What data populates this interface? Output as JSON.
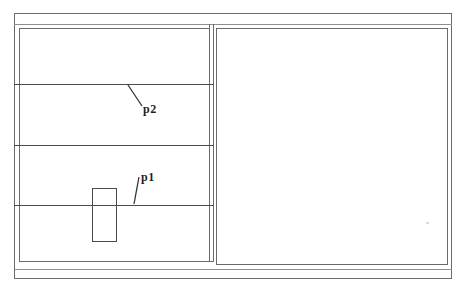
{
  "drawing": {
    "kind": "cad-plan-line-drawing",
    "labels": {
      "p1": "p1",
      "p2": "p2"
    },
    "colors": {
      "border_line": "#6b6b6b",
      "light_line": "#8f8f8f",
      "detail_line": "#4a4a4a",
      "label_text": "#1f1f1f",
      "background": "#ffffff"
    }
  }
}
